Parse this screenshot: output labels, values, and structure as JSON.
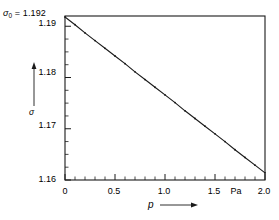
{
  "chart_data": {
    "type": "line",
    "title": "",
    "subtitle": "",
    "xlabel": "p",
    "ylabel": "σ",
    "xunit": "Pa",
    "xlim": [
      0,
      2.0
    ],
    "ylim": [
      1.16,
      1.192
    ],
    "grid": false,
    "legend": "none",
    "annotations": [
      {
        "name": "sigma-zero",
        "symbol": "σ",
        "subscript": "0",
        "equals": "=",
        "value": "1.192",
        "text": "σ₀ = 1.192",
        "position": "top-left-outside",
        "refers_to": "top frame line / y-axis maximum"
      }
    ],
    "x_major_ticks": [
      0,
      0.5,
      1.0,
      1.5,
      2.0
    ],
    "x_tick_labels": [
      "0",
      "0.5",
      "1.0",
      "1.5",
      "2.0"
    ],
    "x_minor_tick_step": 0.1,
    "y_major_ticks": [
      1.16,
      1.17,
      1.18,
      1.19
    ],
    "y_tick_labels": [
      "1.16",
      "1.17",
      "1.18",
      "1.19"
    ],
    "y_minor_tick_step": 0.0025,
    "tick_direction": "in",
    "series": [
      {
        "name": "sigma vs p",
        "marker": "dot",
        "line": "solid",
        "color": "#1a1a1a",
        "x": [
          0.0,
          0.1,
          0.2,
          0.3,
          0.4,
          0.5,
          0.6,
          0.7,
          0.8,
          0.9,
          1.0,
          1.1,
          1.2,
          1.3,
          1.4,
          1.5,
          1.6,
          1.7,
          1.8,
          1.9,
          2.0
        ],
        "y": [
          1.1918,
          1.1903,
          1.1887,
          1.1872,
          1.1857,
          1.1842,
          1.1827,
          1.1811,
          1.1796,
          1.1781,
          1.1766,
          1.1751,
          1.1735,
          1.172,
          1.1705,
          1.169,
          1.1675,
          1.1659,
          1.1644,
          1.1629,
          1.1614
        ]
      }
    ],
    "fit": {
      "intercept": 1.1918,
      "slope": -0.0152,
      "units": "per Pa"
    }
  },
  "axis_labels": {
    "y_name": "σ",
    "x_name": "p",
    "x_unit": "Pa"
  },
  "colors": {
    "background": "#ffffff",
    "frame": "#1a1a1a",
    "data": "#1a1a1a",
    "text": "#000000"
  }
}
